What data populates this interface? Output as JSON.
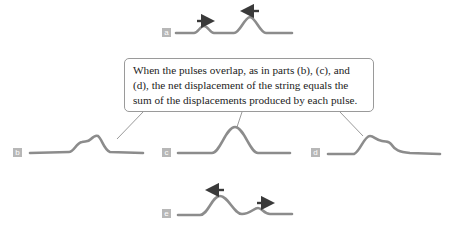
{
  "callout": {
    "text": "When the pulses overlap, as in parts (b), (c), and (d), the net displacement of the string equals the sum of the displacements produced by each pulse."
  },
  "panels": [
    {
      "id": "a",
      "label": "a"
    },
    {
      "id": "b",
      "label": "b"
    },
    {
      "id": "c",
      "label": "c"
    },
    {
      "id": "d",
      "label": "d"
    },
    {
      "id": "e",
      "label": "e"
    }
  ],
  "colors": {
    "string": "#8c8c8c",
    "arrow": "#3a3a3a",
    "label_box": "#b7b7b7",
    "callout_border": "#9a9a9a"
  }
}
